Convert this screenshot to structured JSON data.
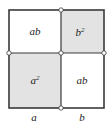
{
  "diagram": {
    "colors": {
      "shaded": "#e3e3e3",
      "plain": "#ffffff",
      "stroke": "#3a3a3a",
      "vertex_fill": "#ffffff"
    },
    "regions": [
      {
        "id": "top-left",
        "label": "ab",
        "sup": "",
        "shaded": false
      },
      {
        "id": "top-right",
        "label": "b",
        "sup": "2",
        "shaded": true
      },
      {
        "id": "bottom-left",
        "label": "a",
        "sup": "2",
        "shaded": true
      },
      {
        "id": "bottom-right",
        "label": "ab",
        "sup": "",
        "shaded": false
      }
    ],
    "side_labels": {
      "left": "a",
      "right": "b"
    }
  }
}
